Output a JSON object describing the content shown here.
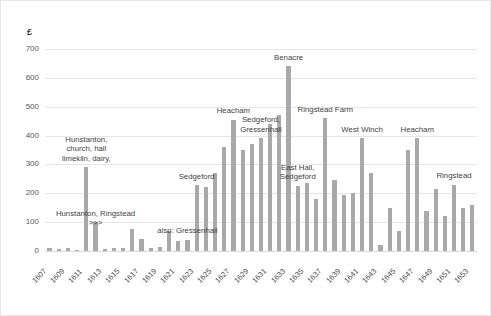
{
  "chart_data": {
    "type": "bar",
    "title": "",
    "xlabel": "",
    "ylabel": "£",
    "ylim": [
      0,
      700
    ],
    "ytick_values": [
      0,
      100,
      200,
      300,
      400,
      500,
      600,
      700
    ],
    "ytick_labels": [
      "0",
      "100",
      "200",
      "300",
      "400",
      "500",
      "600",
      "700"
    ],
    "grid": true,
    "legend": "none",
    "bar_color": "#a9a9a9",
    "categories": [
      "1607",
      "1608",
      "1609",
      "1610",
      "1611",
      "1612",
      "1613",
      "1614",
      "1615",
      "1616",
      "1617",
      "1618",
      "1619",
      "1620",
      "1621",
      "1622",
      "1623",
      "1624",
      "1625",
      "1626",
      "1627",
      "1628",
      "1629",
      "1630",
      "1631",
      "1632",
      "1633",
      "1634",
      "1635",
      "1636",
      "1637",
      "1638",
      "1639",
      "1640",
      "1641",
      "1642",
      "1643",
      "1644",
      "1645",
      "1646",
      "1647",
      "1648",
      "1649",
      "1650",
      "1651",
      "1652",
      "1653"
    ],
    "xtick_labels": [
      "1607",
      "1609",
      "1611",
      "1613",
      "1615",
      "1617",
      "1619",
      "1621",
      "1623",
      "1625",
      "1627",
      "1629",
      "1631",
      "1633",
      "1635",
      "1637",
      "1639",
      "1641",
      "1643",
      "1645",
      "1647",
      "1649",
      "1651",
      "1653"
    ],
    "values": [
      10,
      8,
      12,
      5,
      290,
      100,
      8,
      10,
      12,
      75,
      42,
      10,
      15,
      70,
      35,
      38,
      228,
      222,
      272,
      360,
      455,
      350,
      370,
      390,
      440,
      470,
      640,
      225,
      235,
      180,
      460,
      245,
      195,
      200,
      390,
      270,
      20,
      150,
      70,
      350,
      390,
      140,
      215,
      120,
      230,
      150,
      160
    ],
    "annotations": [
      {
        "text": "Hunstanton,\nchurch, hall\nlimekiln, dairy,",
        "category": "1611"
      },
      {
        "text": "Hunstanton, Ringstead >>>",
        "category": "1612"
      },
      {
        "text": "also: Gressenhall",
        "category": "1622"
      },
      {
        "text": "Sedgeford",
        "category": "1623"
      },
      {
        "text": "Heacham",
        "category": "1627"
      },
      {
        "text": "Sedgeford,\nGressenhall",
        "category": "1630"
      },
      {
        "text": "Benacre",
        "category": "1633"
      },
      {
        "text": "East Hall,\nSedgeford",
        "category": "1634"
      },
      {
        "text": "Ringstead Farm",
        "category": "1637"
      },
      {
        "text": "West Winch",
        "category": "1641"
      },
      {
        "text": "Heacham",
        "category": "1647"
      },
      {
        "text": "Ringstead",
        "category": "1651"
      }
    ]
  }
}
